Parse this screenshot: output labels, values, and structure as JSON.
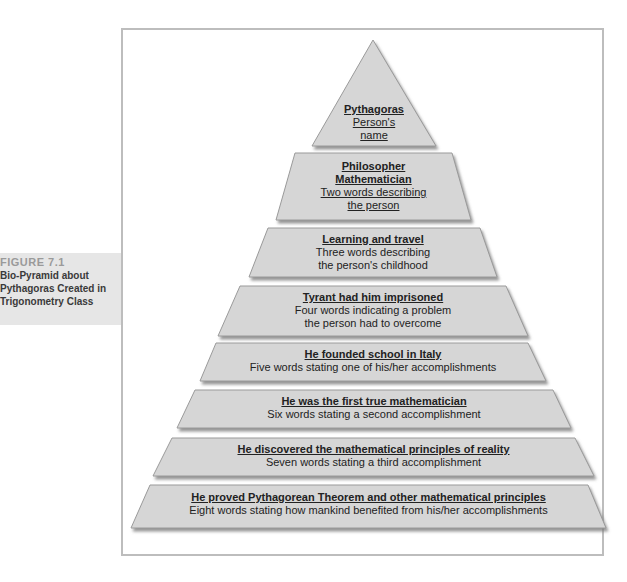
{
  "caption": {
    "figure_number": "FIGURE 7.1",
    "line1": "Bio-Pyramid about",
    "line2": "Pythagoras Created in",
    "line3": "Trigonometry Class"
  },
  "pyramid": {
    "fill_color": "#d6d6d6",
    "shadow_color": "#8a8a8a",
    "tiers": [
      {
        "answer_lines": [
          "Pythagoras"
        ],
        "prompt_lines": [
          "Person's",
          "name"
        ],
        "prompt_underlined": true
      },
      {
        "answer_lines": [
          "Philosopher",
          "Mathematician"
        ],
        "prompt_lines": [
          "Two words describing",
          "the person"
        ],
        "prompt_underlined": true
      },
      {
        "answer_lines": [
          "Learning and travel"
        ],
        "prompt_lines": [
          "Three words describing",
          "the person's childhood"
        ],
        "prompt_underlined": false
      },
      {
        "answer_lines": [
          "Tyrant had him imprisoned"
        ],
        "prompt_lines": [
          "Four words indicating a problem",
          "the person had to overcome"
        ],
        "prompt_underlined": false
      },
      {
        "answer_lines": [
          "He founded school in Italy"
        ],
        "prompt_lines": [
          "Five words stating one of his/her accomplishments"
        ],
        "prompt_underlined": false
      },
      {
        "answer_lines": [
          "He was the first true mathematician"
        ],
        "prompt_lines": [
          "Six words stating a second accomplishment"
        ],
        "prompt_underlined": false
      },
      {
        "answer_lines": [
          "He discovered the mathematical principles of reality"
        ],
        "prompt_lines": [
          "Seven words stating a third accomplishment"
        ],
        "prompt_underlined": false
      },
      {
        "answer_lines": [
          "He proved Pythagorean Theorem and other mathematical principles"
        ],
        "prompt_lines": [
          "Eight words stating how mankind benefited from his/her accomplishments"
        ],
        "prompt_underlined": false
      }
    ]
  }
}
